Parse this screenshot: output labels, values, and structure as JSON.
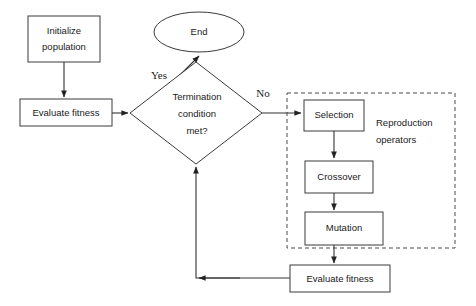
{
  "diagram": {
    "background_color": "#ffffff",
    "line_color": "#333333",
    "text_color": "#1a1a1a",
    "nodes": {
      "initialize_population": {
        "label_line1": "Initialize",
        "label_line2": "population",
        "shape": "rectangle"
      },
      "evaluate_fitness_left": {
        "label": "Evaluate fitness",
        "shape": "rectangle"
      },
      "termination_condition": {
        "label_line1": "Termination",
        "label_line2": "condition",
        "label_line3": "met?",
        "shape": "diamond"
      },
      "end": {
        "label": "End",
        "shape": "ellipse"
      },
      "selection": {
        "label": "Selection",
        "shape": "rectangle"
      },
      "crossover": {
        "label": "Crossover",
        "shape": "rectangle"
      },
      "mutation": {
        "label": "Mutation",
        "shape": "rectangle"
      },
      "evaluate_fitness_bottom": {
        "label": "Evaluate fitness",
        "shape": "rectangle"
      }
    },
    "groups": {
      "reproduction_operators": {
        "label_line1": "Reproduction",
        "label_line2": "operators",
        "border_style": "dashed"
      }
    },
    "edge_labels": {
      "yes": "Yes",
      "no": "No"
    }
  }
}
